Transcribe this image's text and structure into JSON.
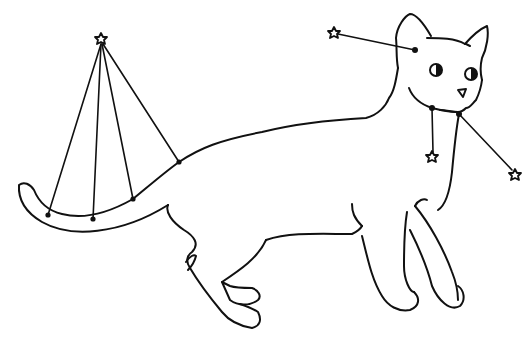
{
  "image": {
    "description": "Line drawing of a walking cat overlaid with constellation stars and connecting lines",
    "subject": "cat",
    "stroke_color": "#111111",
    "background_color": "#ffffff"
  },
  "stars": [
    {
      "name": "tail-apex-star",
      "x": 101,
      "y": 39
    },
    {
      "name": "ear-star",
      "x": 334,
      "y": 33
    },
    {
      "name": "chin-star",
      "x": 432,
      "y": 157
    },
    {
      "name": "chest-star",
      "x": 515,
      "y": 175
    }
  ]
}
